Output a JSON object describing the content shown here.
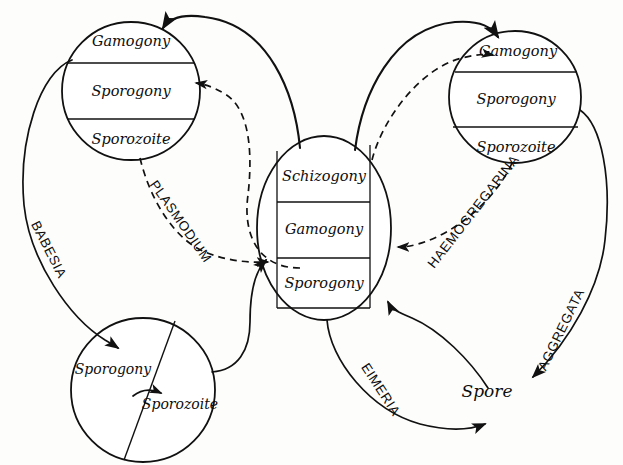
{
  "figure": {
    "kind": "life-cycle-diagram",
    "background_color": "#fdfdfc",
    "ink_color": "#111111"
  },
  "cycles": {
    "babesia_circle": {
      "name": "upper-left-cycle",
      "stages": [
        {
          "label": "Gamogony"
        },
        {
          "label": "Sporogony"
        },
        {
          "label": "Sporozoite"
        }
      ]
    },
    "center_circle": {
      "name": "center-cycle",
      "stages": [
        {
          "label": "Schizogony"
        },
        {
          "label": "Gamogony"
        },
        {
          "label": "Sporogony"
        }
      ]
    },
    "haemogregarina_circle": {
      "name": "upper-right-cycle",
      "stages": [
        {
          "label": "Gamogony"
        },
        {
          "label": "Sporogony"
        },
        {
          "label": "Sporozoite"
        }
      ]
    },
    "lower_left_circle": {
      "name": "lower-left-cycle",
      "stages": [
        {
          "label": "Sporogony"
        },
        {
          "label": "Sporozoite"
        }
      ]
    }
  },
  "genus_labels": [
    {
      "id": "babesia",
      "text": "BABESIA",
      "style": "solid"
    },
    {
      "id": "plasmodium",
      "text": "PLASMODIUM",
      "style": "dashed"
    },
    {
      "id": "haemogregarina",
      "text": "HAEMOGREGARINA",
      "style": "dashed"
    },
    {
      "id": "eimeria",
      "text": "EIMERIA",
      "style": "solid"
    },
    {
      "id": "aggregata",
      "text": "AGGREGATA",
      "style": "solid"
    }
  ],
  "terminal_stage": {
    "id": "spore",
    "label": "Spore"
  }
}
